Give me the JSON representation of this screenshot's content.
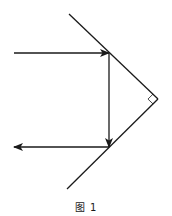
{
  "figure": {
    "caption": "图 1",
    "stroke_color": "#1a1a1a",
    "mirrors": [
      {
        "name": "upper-mirror",
        "x1": 69,
        "y1": 14,
        "x2": 158,
        "y2": 99
      },
      {
        "name": "lower-mirror",
        "x1": 158,
        "y1": 99,
        "x2": 67,
        "y2": 189
      }
    ],
    "rays": [
      {
        "name": "incident-ray",
        "x1": 14,
        "y1": 53,
        "x2": 109,
        "y2": 53,
        "direction": "right"
      },
      {
        "name": "reflected-ray-vertical",
        "x1": 109,
        "y1": 53,
        "x2": 109,
        "y2": 147,
        "direction": "down"
      },
      {
        "name": "emergent-ray",
        "x1": 109,
        "y1": 147,
        "x2": 14,
        "y2": 147,
        "direction": "left"
      }
    ],
    "right_angle_marker": {
      "vertex_x": 158,
      "vertex_y": 99,
      "size": 7
    },
    "angle_between_mirrors": "90°"
  }
}
